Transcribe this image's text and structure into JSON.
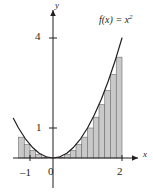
{
  "figure": {
    "title": "",
    "function_label": "f(x) = x",
    "function_exponent": "2",
    "axis_x_label": "x",
    "axis_y_label": "y"
  },
  "ticks": {
    "x": [
      {
        "value": -1,
        "label": "–1"
      },
      {
        "value": 0,
        "label": "0"
      },
      {
        "value": 2,
        "label": "2"
      }
    ],
    "y": [
      {
        "value": 1,
        "label": "1"
      },
      {
        "value": 4,
        "label": "4"
      }
    ]
  },
  "colors": {
    "curve": "#231f20",
    "axis": "#231f20",
    "rect_fill": "#c9c9c9",
    "rect_stroke": "#6d6d6d",
    "text": "#231f20",
    "background": "#ffffff"
  },
  "chart_data": {
    "type": "area",
    "title": "",
    "subtitle": "",
    "xlabel": "x",
    "ylabel": "y",
    "grid": false,
    "legend": "none",
    "annotations": [
      "f(x) = x²"
    ],
    "xlim": [
      -1.35,
      2.4
    ],
    "ylim": [
      -0.3,
      4.6
    ],
    "xticks": [
      -1,
      0,
      2
    ],
    "xticklabels": [
      "–1",
      "0",
      "2"
    ],
    "yticks": [
      1,
      4
    ],
    "yticklabels": [
      "1",
      "4"
    ],
    "curve": {
      "name": "f(x) = x^2",
      "expression": "x^2",
      "x_domain": [
        -1.15,
        2.05
      ],
      "x": [
        -1.15,
        -1.0,
        -0.8,
        -0.6,
        -0.4,
        -0.2,
        0.0,
        0.2,
        0.4,
        0.6,
        0.8,
        1.0,
        1.2,
        1.4,
        1.6,
        1.8,
        2.0
      ],
      "y": [
        1.3225,
        1.0,
        0.64,
        0.36,
        0.16,
        0.04,
        0.0,
        0.04,
        0.16,
        0.36,
        0.64,
        1.0,
        1.44,
        1.96,
        2.56,
        3.24,
        4.0
      ]
    },
    "riemann_rectangles": {
      "description": "Inscribed rectangles approximating the area under f(x)=x^2 on [-1,2]",
      "width": 0.166667,
      "left_panel": {
        "interval": [
          -1,
          0
        ],
        "rule": "right-endpoint",
        "count": 6,
        "x_left": [
          -1.0,
          -0.833333,
          -0.666667,
          -0.5,
          -0.333333,
          -0.166667
        ],
        "x_right": [
          -0.833333,
          -0.666667,
          -0.5,
          -0.333333,
          -0.166667,
          0.0
        ],
        "heights": [
          0.694444,
          0.444444,
          0.25,
          0.111111,
          0.027778,
          0.0
        ]
      },
      "right_panel": {
        "interval": [
          0,
          2
        ],
        "rule": "left-endpoint",
        "count": 12,
        "x_left": [
          0.0,
          0.166667,
          0.333333,
          0.5,
          0.666667,
          0.833333,
          1.0,
          1.166667,
          1.333333,
          1.5,
          1.666667,
          1.833333
        ],
        "x_right": [
          0.166667,
          0.333333,
          0.5,
          0.666667,
          0.833333,
          1.0,
          1.166667,
          1.333333,
          1.5,
          1.666667,
          1.833333,
          2.0
        ],
        "heights": [
          0.0,
          0.027778,
          0.111111,
          0.25,
          0.444444,
          0.694444,
          1.0,
          1.361111,
          1.777778,
          2.25,
          2.777778,
          3.361111
        ]
      }
    }
  }
}
